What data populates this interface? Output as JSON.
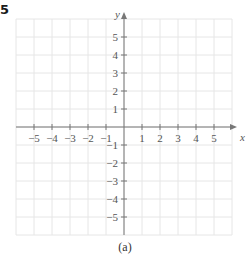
{
  "problem_number": "5",
  "caption": "(a)",
  "chart_data": {
    "type": "scatter",
    "title": "",
    "xlabel": "x",
    "ylabel": "y",
    "xlim": [
      -6,
      6
    ],
    "ylim": [
      -6,
      6
    ],
    "grid": true,
    "x_ticks": [
      -5,
      -4,
      -3,
      -2,
      -1,
      1,
      2,
      3,
      4,
      5
    ],
    "y_ticks": [
      -5,
      -4,
      -3,
      -2,
      -1,
      1,
      2,
      3,
      4,
      5
    ],
    "x_tick_labels": [
      "−5",
      "−4",
      "−3",
      "−2",
      "−1",
      "1",
      "2",
      "3",
      "4",
      "5"
    ],
    "y_tick_labels": [
      "−5",
      "−4",
      "−3",
      "−2",
      "−1",
      "1",
      "2",
      "3",
      "4",
      "5"
    ],
    "series": [],
    "legend": null
  },
  "colors": {
    "grid": "#e6e6e6",
    "axis": "#777777",
    "text": "#555555"
  }
}
